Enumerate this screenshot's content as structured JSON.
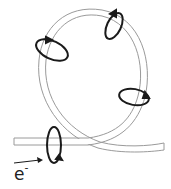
{
  "diagram": {
    "particle_label": "e",
    "particle_charge": "-",
    "direction_arrow": "right",
    "field_loops": [
      {
        "name": "field-loop-bottom-left",
        "cx": 53,
        "cy": 150
      },
      {
        "name": "field-loop-upper-left",
        "cx": 52,
        "cy": 51
      },
      {
        "name": "field-loop-top-right",
        "cx": 114,
        "cy": 28
      },
      {
        "name": "field-loop-right",
        "cx": 136,
        "cy": 99
      }
    ],
    "colors": {
      "wire_stroke": "#9a9a9a",
      "field_stroke": "#1a1a1a",
      "background": "#ffffff"
    }
  }
}
